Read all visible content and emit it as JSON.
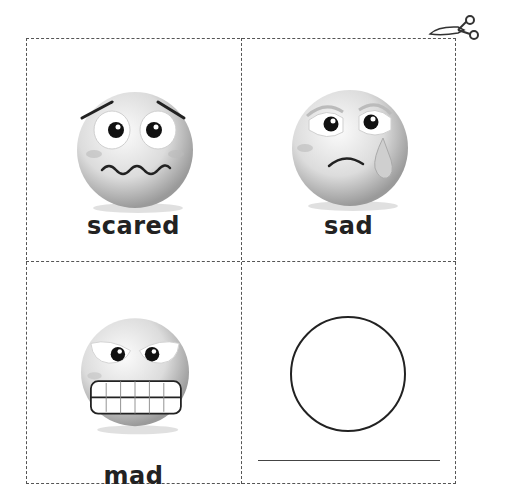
{
  "worksheet": {
    "cards": [
      {
        "label": "scared",
        "face": "scared-face-icon"
      },
      {
        "label": "sad",
        "face": "sad-face-icon"
      },
      {
        "label": "mad",
        "face": "mad-face-icon"
      },
      {
        "label": "",
        "face": "blank-circle-to-draw"
      }
    ],
    "cut_guide_icon": "scissors-icon",
    "colors": {
      "dashed_border": "#555555",
      "label_text": "#222222",
      "face_gray_light": "#f2f2f2",
      "face_gray_dark": "#a8a8a8"
    }
  }
}
